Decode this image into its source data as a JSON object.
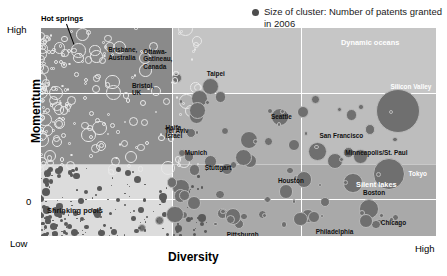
{
  "legend": {
    "marker": "filled-circle",
    "text": "Size of cluster: Number of patents granted in 2006"
  },
  "axes": {
    "x_title": "Diversity",
    "y_title": "Momentum",
    "x_ticks": [
      "High"
    ],
    "y_ticks": [
      "High",
      "0",
      "Low"
    ]
  },
  "quadrants": [
    {
      "id": "hot-springs",
      "label": "Hot springs"
    },
    {
      "id": "dynamic-oceans",
      "label": "Dynamic oceans"
    },
    {
      "id": "shrinking-pools",
      "label": "Shrinking pools"
    },
    {
      "id": "silent-lakes",
      "label": "Silent lakes"
    }
  ],
  "colors": {
    "panel_base": "#c9c9c9",
    "panel_dark": "#8e8e8e",
    "panel_mid": "#a8a8a8",
    "panel_light": "#d9d9d9",
    "bubble_fill": "#6f6f6f",
    "bubble_outline": "#e8e8e8",
    "gridline": "#ffffff",
    "text": "#111111"
  },
  "chart_data": {
    "type": "scatter",
    "title": "",
    "xlabel": "Diversity",
    "ylabel": "Momentum",
    "xlim": [
      "Low",
      "High"
    ],
    "ylim": [
      "Low",
      "High"
    ],
    "grid": true,
    "legend_position": "top-right",
    "size_encoding": "Number of patents granted in 2006",
    "annotations": [
      "Hot springs",
      "Dynamic oceans",
      "Shrinking pools",
      "Silent lakes"
    ],
    "points": [
      {
        "label": "Brisbane,\nAustralia",
        "x": 0.155,
        "y": 0.845,
        "r": 3.6,
        "style": "hollow"
      },
      {
        "label": "Bristol,\nUK",
        "x": 0.215,
        "y": 0.675,
        "r": 3.2,
        "style": "hollow"
      },
      {
        "label": "Haifa,\nIsrael",
        "x": 0.305,
        "y": 0.47,
        "r": 3.2,
        "style": "hollow"
      },
      {
        "label": "Ottawa-\nGatineau,\nCanada",
        "x": 0.345,
        "y": 0.76,
        "r": 4.8,
        "style": "solid"
      },
      {
        "label": "Taipei",
        "x": 0.43,
        "y": 0.72,
        "r": 8.6,
        "style": "solid"
      },
      {
        "label": "Tel Aviv",
        "x": 0.38,
        "y": 0.495,
        "r": 5.4,
        "style": "solid"
      },
      {
        "label": "Munich",
        "x": 0.43,
        "y": 0.36,
        "r": 6.4,
        "style": "solid"
      },
      {
        "label": "Stuttgart",
        "x": 0.47,
        "y": 0.32,
        "r": 6.0,
        "style": "solid"
      },
      {
        "label": "Seattle",
        "x": 0.605,
        "y": 0.57,
        "r": 9.0,
        "style": "solid"
      },
      {
        "label": "San Francisco",
        "x": 0.7,
        "y": 0.405,
        "r": 9.4,
        "style": "solid"
      },
      {
        "label": "Minneapolis/St. Paul",
        "x": 0.745,
        "y": 0.36,
        "r": 8.2,
        "style": "solid"
      },
      {
        "label": "Silicon Valley",
        "x": 0.905,
        "y": 0.6,
        "r": 22.0,
        "style": "solid"
      },
      {
        "label": "Tokyo",
        "x": 0.88,
        "y": 0.3,
        "r": 16.0,
        "style": "solid"
      },
      {
        "label": "Boston",
        "x": 0.79,
        "y": 0.255,
        "r": 9.6,
        "style": "solid"
      },
      {
        "label": "Chicago",
        "x": 0.83,
        "y": 0.13,
        "r": 9.8,
        "style": "solid"
      },
      {
        "label": "Houston",
        "x": 0.62,
        "y": 0.215,
        "r": 7.4,
        "style": "solid"
      },
      {
        "label": "Philadelphia",
        "x": 0.675,
        "y": 0.095,
        "r": 7.0,
        "style": "solid"
      },
      {
        "label": "Pittsburgh",
        "x": 0.46,
        "y": 0.11,
        "r": 5.6,
        "style": "solid"
      },
      {
        "label": "Indianapolis",
        "x": 0.5,
        "y": 0.06,
        "r": 5.0,
        "style": "solid"
      },
      {
        "label": "London",
        "x": 0.3,
        "y": 0.075,
        "r": 4.4,
        "style": "solid"
      },
      {
        "label": "Stockholm",
        "x": 0.255,
        "y": 0.04,
        "r": 4.0,
        "style": "solid"
      }
    ]
  }
}
